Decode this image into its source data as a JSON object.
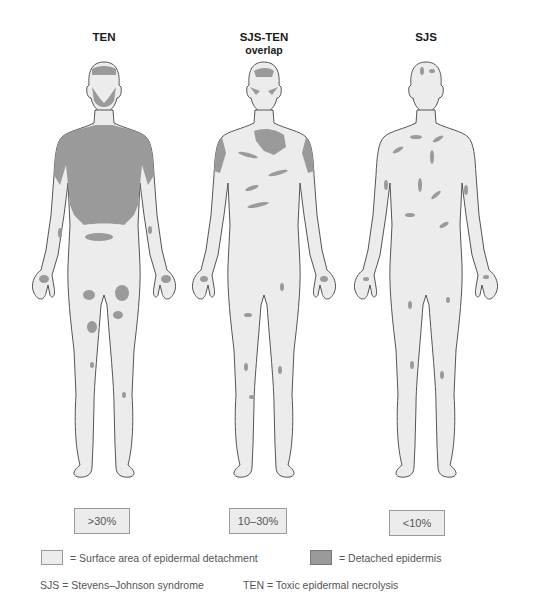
{
  "figures": [
    {
      "id": "ten",
      "title": "TEN",
      "subtitle": "",
      "percentage": ">30%",
      "severity": "extensive"
    },
    {
      "id": "sjs-ten",
      "title": "SJS-TEN",
      "subtitle": "overlap",
      "percentage": "10–30%",
      "severity": "moderate"
    },
    {
      "id": "sjs",
      "title": "SJS",
      "subtitle": "",
      "percentage": "<10%",
      "severity": "limited"
    }
  ],
  "legend": {
    "surface_area": {
      "label": "= Surface area of epidermal detachment",
      "color": "#ececec"
    },
    "detached": {
      "label": "= Detached epidermis",
      "color": "#9a9a9a"
    }
  },
  "abbreviations": {
    "sjs": "SJS = Stevens–Johnson syndrome",
    "ten": "TEN = Toxic epidermal necrolysis"
  },
  "colors": {
    "skin": "#ececec",
    "outline": "#555555",
    "lesion": "#9a9a9a"
  }
}
